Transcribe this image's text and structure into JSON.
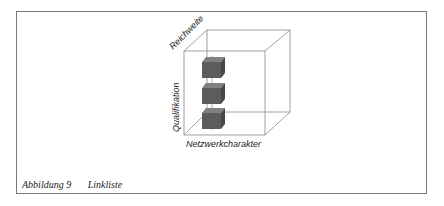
{
  "diagram": {
    "axes": {
      "depth_label": "Reichweite",
      "vertical_label": "Qualifikation",
      "horizontal_label": "Netzwerkcharakter"
    },
    "boxes": [
      {
        "position": "top"
      },
      {
        "position": "middle"
      },
      {
        "position": "bottom"
      }
    ],
    "colors": {
      "box_front": "#5a5a5a",
      "box_top": "#7d7d7d",
      "box_side": "#454545",
      "cube_edge": "#8a8a8a",
      "frame": "#7a7a7a"
    }
  },
  "caption": {
    "figure": "Abbildung 9",
    "title": "Linkliste"
  }
}
